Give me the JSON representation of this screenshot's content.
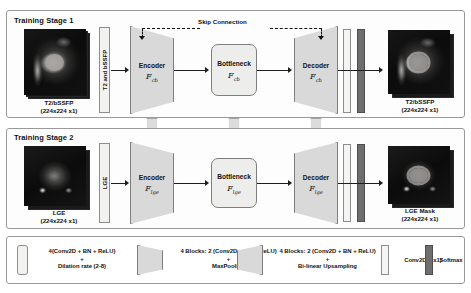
{
  "stage1": {
    "title": "Training Stage 1",
    "input": {
      "bar_label": "T2 and bSSFP",
      "caption_name": "T2/bSSFP",
      "caption_dims": "(224x224 x1)"
    },
    "encoder": {
      "label": "Encoder",
      "symbol": "F",
      "subscript": "cb"
    },
    "bottleneck": {
      "label": "Bottleneck",
      "symbol": "F",
      "subscript": "cb"
    },
    "decoder": {
      "label": "Decoder",
      "symbol": "F",
      "subscript": "cb"
    },
    "skip_label": "Skip Connection",
    "output": {
      "caption_name": "T2/bSSFP",
      "caption_dims": "(224x224 x1)"
    }
  },
  "stage2": {
    "title": "Training Stage 2",
    "input": {
      "bar_label": "LGE",
      "caption_name": "LGE",
      "caption_dims": "(224x224 x1)"
    },
    "encoder": {
      "label": "Encoder",
      "symbol": "F",
      "subscript": "lge"
    },
    "bottleneck": {
      "label": "Bottleneck",
      "symbol": "F",
      "subscript": "lge"
    },
    "decoder": {
      "label": "Decoder",
      "symbol": "F",
      "subscript": "lge"
    },
    "output": {
      "caption_name": "LGE Mask",
      "caption_dims": "(224x224 x1)"
    }
  },
  "transfer": {
    "label": "Transferring weights between two models"
  },
  "legend": {
    "items": [
      {
        "shape": "slab",
        "line1": "4(Conv2D + BN + ReLU)",
        "line2": "+",
        "line3": "Dilation rate (2-8)"
      },
      {
        "shape": "encoder-trapezoid",
        "line1": "4 Blocks: 2 (Conv2D + BN + ReLU)",
        "line2": "+",
        "line3": "MaxPooling"
      },
      {
        "shape": "decoder-trapezoid",
        "line1": "4 Blocks: 2 (Conv2D + BN + ReLU)",
        "line2": "+",
        "line3": "Bi-linear Upsampling"
      },
      {
        "shape": "light-bar",
        "line1": "Conv2D (1x1)"
      },
      {
        "shape": "dark-bar",
        "line1": "Softmax"
      }
    ]
  },
  "colors": {
    "block_fill": "#d9d9d9",
    "slab_fill": "#f2f2f0",
    "dark_bar": "#6e6e6e",
    "border": "#8d8d8d",
    "arrow": "#1d1d1d",
    "panel_border": "#9a9a9a"
  }
}
